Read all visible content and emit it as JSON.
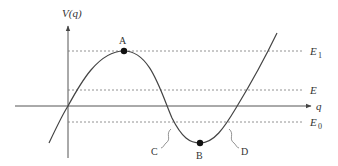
{
  "diagram": {
    "type": "potential-energy-curve",
    "y_axis_label": "V(q)",
    "x_axis_label": "q",
    "energy_levels": [
      {
        "id": "E1",
        "label": "E",
        "subscript": "1"
      },
      {
        "id": "E",
        "label": "E",
        "subscript": ""
      },
      {
        "id": "E0",
        "label": "E",
        "subscript": "0"
      }
    ],
    "points": [
      {
        "id": "A",
        "label": "A",
        "description": "local maximum on curve at E1"
      },
      {
        "id": "B",
        "label": "B",
        "description": "local minimum on curve"
      }
    ],
    "annotations": [
      {
        "id": "C",
        "label": "C",
        "description": "left crossing of curve with E0"
      },
      {
        "id": "D",
        "label": "D",
        "description": "right crossing of curve with E0"
      }
    ],
    "colors": {
      "curve": "#444444",
      "axis": "#555555",
      "guide": "#777777",
      "point": "#111111",
      "text": "#333333"
    }
  }
}
